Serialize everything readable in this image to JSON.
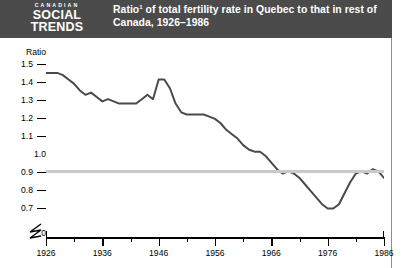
{
  "header": {
    "logo_kicker": "CANADIAN",
    "logo_line1": "SOCIAL",
    "logo_line2": "TRENDS",
    "title_main": "Ratio",
    "title_sup": "1",
    "title_rest": " of total fertility rate in Quebec to that in rest of Canada, 1926–1986",
    "band_color": "#4b4b4b",
    "text_color": "#ffffff"
  },
  "chart_data": {
    "type": "line",
    "xlabel": "",
    "ylabel": "Ratio",
    "ylim": [
      0.7,
      1.5
    ],
    "xlim": [
      1926,
      1986
    ],
    "grid": false,
    "legend": "none",
    "reference_line": {
      "value": 1.0,
      "color": "#c9c9c9",
      "label": "1.0"
    },
    "axis_break": {
      "between": [
        0,
        0.7
      ],
      "symbol": "zigzag"
    },
    "ytick_labels": [
      "1.5",
      "1.4",
      "1.3",
      "1.2",
      "1.1",
      "1.0",
      "0.9",
      "0.8",
      "0.7",
      "0"
    ],
    "ytick_values": [
      1.5,
      1.4,
      1.3,
      1.2,
      1.1,
      1.0,
      0.9,
      0.8,
      0.7,
      0
    ],
    "xtick_labels": [
      "1926",
      "1936",
      "1946",
      "1956",
      "1966",
      "1976",
      "1986"
    ],
    "xtick_values": [
      1926,
      1936,
      1946,
      1956,
      1966,
      1976,
      1986
    ],
    "xminor_values": [
      1931,
      1941,
      1951,
      1961,
      1971,
      1981
    ],
    "line_color": "#4a4a4a",
    "series": [
      {
        "name": "Quebec / rest of Canada total fertility ratio",
        "x": [
          1926,
          1927,
          1928,
          1929,
          1930,
          1931,
          1932,
          1933,
          1934,
          1935,
          1936,
          1937,
          1938,
          1939,
          1940,
          1941,
          1942,
          1943,
          1944,
          1945,
          1946,
          1947,
          1948,
          1949,
          1950,
          1951,
          1952,
          1953,
          1954,
          1955,
          1956,
          1957,
          1958,
          1959,
          1960,
          1961,
          1962,
          1963,
          1964,
          1965,
          1966,
          1967,
          1968,
          1969,
          1970,
          1971,
          1972,
          1973,
          1974,
          1975,
          1976,
          1977,
          1978,
          1979,
          1980,
          1981,
          1982,
          1983,
          1984,
          1985,
          1986
        ],
        "values": [
          1.45,
          1.45,
          1.45,
          1.44,
          1.42,
          1.4,
          1.37,
          1.35,
          1.36,
          1.34,
          1.32,
          1.33,
          1.32,
          1.31,
          1.31,
          1.31,
          1.31,
          1.33,
          1.35,
          1.33,
          1.42,
          1.42,
          1.38,
          1.31,
          1.27,
          1.26,
          1.26,
          1.26,
          1.26,
          1.25,
          1.24,
          1.22,
          1.19,
          1.17,
          1.15,
          1.12,
          1.1,
          1.09,
          1.09,
          1.07,
          1.04,
          1.01,
          0.99,
          1.0,
          0.99,
          0.97,
          0.94,
          0.91,
          0.88,
          0.85,
          0.83,
          0.83,
          0.85,
          0.9,
          0.95,
          0.99,
          1.0,
          0.99,
          1.01,
          1.0,
          0.97
        ]
      }
    ]
  },
  "axes": {
    "ylabel_text": "Ratio",
    "zero_label": "0"
  }
}
